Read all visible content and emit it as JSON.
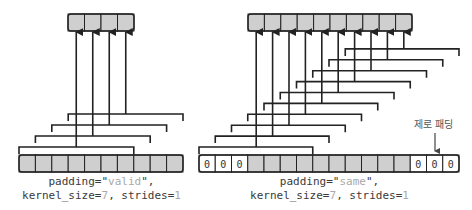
{
  "colors": {
    "cell_fill": "#cfcfcf",
    "pad_fill": "#ffffff",
    "stroke": "#222222",
    "highlight_text": "#a9a9a9"
  },
  "diagrams": [
    {
      "id": "valid",
      "caption": {
        "line1_prefix": "padding=\"",
        "line1_value": "valid",
        "line1_suffix": "\",",
        "line2_a": "kernel_size=",
        "line2_k": "7",
        "line2_b": ", strides=",
        "line2_s": "1"
      },
      "input": {
        "x": 19,
        "y": 155,
        "cell_w": 16.4,
        "h": 17,
        "pad_left": 0,
        "real": 10,
        "pad_right": 0,
        "pad_label": "0"
      },
      "output": {
        "x": 68,
        "y": 14,
        "cell_w": 16.5,
        "h": 17,
        "cells": 10,
        "count": 4
      },
      "kernel_size": 7,
      "bracket_base_y": 147,
      "bracket_step": 11
    },
    {
      "id": "same",
      "caption": {
        "line1_prefix": "padding=\"",
        "line1_value": "same",
        "line1_suffix": "\",",
        "line2_a": "kernel_size=",
        "line2_k": "7",
        "line2_b": ", strides=",
        "line2_s": "1"
      },
      "input": {
        "x": 199,
        "y": 155,
        "cell_w": 16.25,
        "h": 17,
        "pad_left": 3,
        "real": 10,
        "pad_right": 3,
        "pad_label": "0"
      },
      "output": {
        "x": 248,
        "y": 14,
        "cell_w": 16.4,
        "h": 17,
        "count": 10
      },
      "kernel_size": 7,
      "bracket_base_y": 147,
      "bracket_step": 10.9
    }
  ],
  "annotation": {
    "label": "제로 패딩"
  }
}
